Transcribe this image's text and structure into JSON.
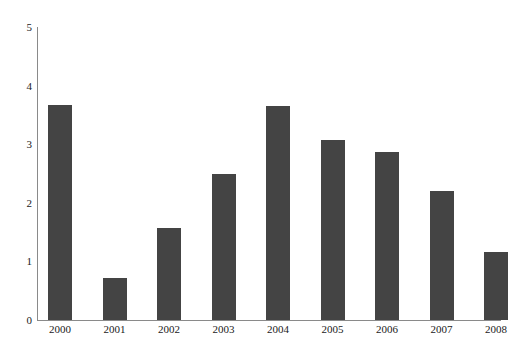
{
  "chart_data": {
    "type": "bar",
    "title": "",
    "subtitle": "",
    "xlabel": "",
    "ylabel": "",
    "categories": [
      "2000",
      "2001",
      "2002",
      "2003",
      "2004",
      "2005",
      "2006",
      "2007",
      "2008"
    ],
    "values": [
      3.67,
      0.72,
      1.57,
      2.5,
      3.65,
      3.07,
      2.87,
      2.2,
      1.16
    ],
    "ylim": [
      0,
      5
    ],
    "ytick_labels": [
      "0",
      "1",
      "2",
      "3",
      "4",
      "5"
    ],
    "ytick_values": [
      0,
      1,
      2,
      3,
      4,
      5
    ],
    "grid": false,
    "legend": null,
    "legend_position": "none",
    "annotations": [],
    "bar_color": "#444444",
    "axis_color": "#8a8a8a",
    "background_color": "#ffffff"
  }
}
